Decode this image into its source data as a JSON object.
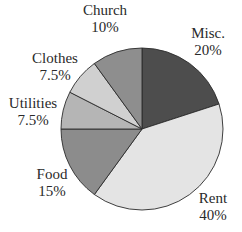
{
  "chart_data": {
    "type": "pie",
    "title": "",
    "start_angle_deg": 0,
    "direction": "clockwise",
    "center": [
      142,
      129
    ],
    "radius": 81,
    "slices": [
      {
        "label": "Misc.",
        "value": 20,
        "display": "20%",
        "color": "#4d4d4d"
      },
      {
        "label": "Rent",
        "value": 40,
        "display": "40%",
        "color": "#e4e4e4"
      },
      {
        "label": "Food",
        "value": 15,
        "display": "15%",
        "color": "#8c8c8c"
      },
      {
        "label": "Utilities",
        "value": 7.5,
        "display": "7.5%",
        "color": "#b5b5b5"
      },
      {
        "label": "Clothes",
        "value": 7.5,
        "display": "7.5%",
        "color": "#d0d0d0"
      },
      {
        "label": "Church",
        "value": 10,
        "display": "10%",
        "color": "#8e8e8e"
      }
    ],
    "legend": "none (direct labels)"
  },
  "labels": {
    "misc": {
      "name": "Misc.",
      "pct": "20%"
    },
    "rent": {
      "name": "Rent",
      "pct": "40%"
    },
    "food": {
      "name": "Food",
      "pct": "15%"
    },
    "utilities": {
      "name": "Utilities",
      "pct": "7.5%"
    },
    "clothes": {
      "name": "Clothes",
      "pct": "7.5%"
    },
    "church": {
      "name": "Church",
      "pct": "10%"
    }
  }
}
